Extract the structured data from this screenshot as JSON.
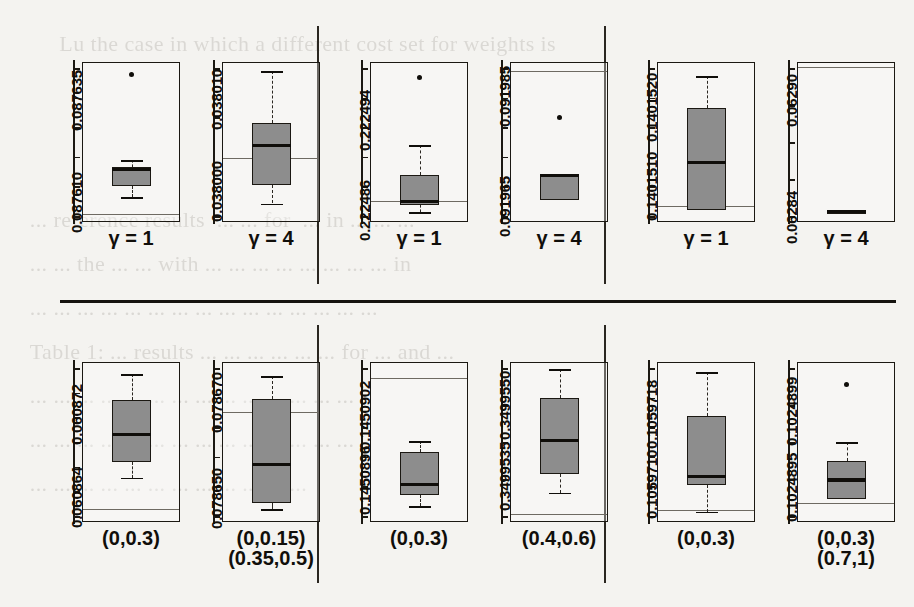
{
  "figure": {
    "type": "boxplot-grid",
    "rows": 2,
    "groups_per_row": 3,
    "panels_per_group": 2,
    "colors": {
      "box_fill": "#8d8d8d",
      "ink": "#100e0a",
      "reference_line": "#6e6a62",
      "page": "#f4f3f0"
    }
  },
  "ghost_text": "       Lu the case in which a different cost set for weights is\n\n\n\n  ... reference results  ... ... for  ... in ... ... ...\n  ... ... the ... ... with ... ... ... ... ... ... ... ... in\n  ... ... ... ... ... ... ... ... ... ... ... ... ... ... ...\n  Table 1: ... results ... ... ... ... ... ... for ... and ...\n  ... ... ... ... ... ... ... ... ... ... ... ... ... ...\n  ... ... ... ... ... ... ... ... ... ... ... ... ... ...\n  ... ... ... ... ... ... ... ... ... ... ... ...\n\n\n  ... Version\n\n\n  ... ... ... ... ...",
  "chart_data": [
    {
      "type": "boxplot",
      "id": "row1-group1-panel1",
      "row": 1,
      "group": 1,
      "index": 1,
      "xlabel": [
        "γ = 1"
      ],
      "ytick_labels": [
        "0.087610",
        "0.087635"
      ],
      "ytick_values": [
        0.08761,
        0.087635
      ],
      "ylim": [
        0.0876025,
        0.0876415
      ],
      "n_ticks": 6,
      "reference_line": 0.0876045,
      "stats": {
        "min": 0.0876085,
        "q1": 0.0876113,
        "median": 0.0876152,
        "q3": 0.0876158,
        "max": 0.0876175
      },
      "outliers": [
        0.0876385
      ]
    },
    {
      "type": "boxplot",
      "id": "row1-group1-panel2",
      "row": 1,
      "group": 1,
      "index": 2,
      "xlabel": [
        "γ = 4"
      ],
      "ytick_labels": [
        "0.038000",
        "0.038010"
      ],
      "ytick_values": [
        0.038,
        0.03801
      ],
      "ylim": [
        0.0379955,
        0.0380128
      ],
      "n_ticks": 4,
      "reference_line": 0.0380024,
      "stats": {
        "min": 0.0379975,
        "q1": 0.0379995,
        "median": 0.0380038,
        "q3": 0.0380062,
        "max": 0.0380118
      },
      "outliers": []
    },
    {
      "type": "boxplot",
      "id": "row1-group2-panel1",
      "row": 1,
      "group": 2,
      "index": 1,
      "xlabel": [
        "γ = 1"
      ],
      "ytick_labels": [
        "0.222486",
        "0.222494"
      ],
      "ytick_values": [
        0.222486,
        0.222494
      ],
      "ylim": [
        0.222484,
        0.2224982
      ],
      "n_ticks": 6,
      "reference_line": 0.2224859,
      "stats": {
        "min": 0.2224849,
        "q1": 0.2224855,
        "median": 0.2224858,
        "q3": 0.2224882,
        "max": 0.2224908
      },
      "outliers": [
        0.2224968
      ]
    },
    {
      "type": "boxplot",
      "id": "row1-group2-panel2",
      "row": 1,
      "group": 2,
      "index": 2,
      "xlabel": [
        "γ = 4"
      ],
      "ytick_labels": [
        "0.091965",
        "0.091985"
      ],
      "ytick_values": [
        0.091965,
        0.091985
      ],
      "ylim": [
        0.09196,
        0.0919892
      ],
      "n_ticks": 6,
      "reference_line": 0.0919875,
      "stats": {
        "min": 0.091964,
        "q1": 0.091964,
        "median": 0.0919685,
        "q3": 0.0919688,
        "max": 0.0919688
      },
      "outliers": [
        0.091979
      ]
    },
    {
      "type": "boxplot",
      "id": "row1-group3-panel1",
      "row": 1,
      "group": 3,
      "index": 1,
      "xlabel": [
        "γ = 1"
      ],
      "ytick_labels": [
        "0.1401510",
        "0.1401520"
      ],
      "ytick_values": [
        0.140151,
        0.140152
      ],
      "ylim": [
        0.14015045,
        0.14015248
      ],
      "n_ticks": 6,
      "reference_line": 0.14015065,
      "stats": {
        "min": 0.1401506,
        "q1": 0.1401506,
        "median": 0.1401512,
        "q3": 0.1401519,
        "max": 0.1401523
      },
      "outliers": []
    },
    {
      "type": "boxplot",
      "id": "row1-group3-panel2",
      "row": 1,
      "group": 3,
      "index": 2,
      "xlabel": [
        "γ = 4"
      ],
      "ytick_labels": [
        "0.06284",
        "0.06290"
      ],
      "ytick_values": [
        0.06284,
        0.0629
      ],
      "ylim": [
        0.06283,
        0.0629115
      ],
      "n_ticks": 5,
      "reference_line": 0.062909,
      "stats": {
        "min": 0.0628345,
        "q1": 0.0628348,
        "median": 0.0628352,
        "q3": 0.0628356,
        "max": 0.0628358
      },
      "outliers": []
    },
    {
      "type": "boxplot",
      "id": "row2-group1-panel1",
      "row": 2,
      "group": 1,
      "index": 1,
      "xlabel": [
        "(0,0.3)"
      ],
      "ytick_labels": [
        "0.060864",
        "0.060872"
      ],
      "ytick_values": [
        0.060864,
        0.060872
      ],
      "ylim": [
        0.0608605,
        0.060876
      ],
      "n_ticks": 7,
      "reference_line": 0.0608618,
      "stats": {
        "min": 0.0608648,
        "q1": 0.0608663,
        "median": 0.060869,
        "q3": 0.0608723,
        "max": 0.0608748
      },
      "outliers": []
    },
    {
      "type": "boxplot",
      "id": "row2-group1-panel2",
      "row": 2,
      "group": 1,
      "index": 2,
      "xlabel": [
        "(0,0.15)",
        "(0.35,0.5)"
      ],
      "ytick_labels": [
        "0.078650",
        "0.078670"
      ],
      "ytick_values": [
        0.07865,
        0.07867
      ],
      "ylim": [
        0.0786428,
        0.078676
      ],
      "n_ticks": 6,
      "reference_line": 0.0786656,
      "stats": {
        "min": 0.0786455,
        "q1": 0.0786468,
        "median": 0.0786548,
        "q3": 0.0786683,
        "max": 0.078673
      },
      "outliers": []
    },
    {
      "type": "boxplot",
      "id": "row2-group2-panel1",
      "row": 2,
      "group": 2,
      "index": 1,
      "xlabel": [
        "(0,0.3)"
      ],
      "ytick_labels": [
        "0.1450896",
        "0.1450902"
      ],
      "ytick_values": [
        0.1450896,
        0.1450902
      ],
      "ylim": [
        0.14508915,
        0.14509063
      ],
      "n_ticks": 6,
      "reference_line": 0.14509048,
      "stats": {
        "min": 0.1450893,
        "q1": 0.1450894,
        "median": 0.1450895,
        "q3": 0.1450898,
        "max": 0.1450899
      },
      "outliers": []
    },
    {
      "type": "boxplot",
      "id": "row2-group2-panel2",
      "row": 2,
      "group": 2,
      "index": 2,
      "xlabel": [
        "(0.4,0.6)"
      ],
      "ytick_labels": [
        "0.3499535",
        "0.3499550"
      ],
      "ytick_values": [
        0.3499535,
        0.349955
      ],
      "ylim": [
        0.34995238,
        0.34995575
      ],
      "n_ticks": 5,
      "reference_line": 0.34995255,
      "stats": {
        "min": 0.349953,
        "q1": 0.3499534,
        "median": 0.3499541,
        "q3": 0.349955,
        "max": 0.3499556
      },
      "outliers": []
    },
    {
      "type": "boxplot",
      "id": "row2-group3-panel1",
      "row": 2,
      "group": 3,
      "index": 1,
      "xlabel": [
        "(0,0.3)"
      ],
      "ytick_labels": [
        "0.1059710",
        "0.1059718"
      ],
      "ytick_values": [
        0.105971,
        0.1059718
      ],
      "ylim": [
        0.10597048,
        0.10597232
      ],
      "n_ticks": 6,
      "reference_line": 0.10597062,
      "stats": {
        "min": 0.1059706,
        "q1": 0.1059709,
        "median": 0.105971,
        "q3": 0.1059717,
        "max": 0.1059722
      },
      "outliers": []
    },
    {
      "type": "boxplot",
      "id": "row2-group3-panel2",
      "row": 2,
      "group": 3,
      "index": 2,
      "xlabel": [
        "(0,0.3)",
        "(0.7,1)"
      ],
      "ytick_labels": [
        "0.1024895",
        "0.1024899"
      ],
      "ytick_values": [
        0.1024895,
        0.1024899
      ],
      "ylim": [
        0.10248928,
        0.10249012
      ],
      "n_ticks": 5,
      "reference_line": 0.10248938,
      "stats": {
        "min": 0.1024894,
        "q1": 0.1024894,
        "median": 0.1024895,
        "q3": 0.1024896,
        "max": 0.1024897
      },
      "outliers": [
        0.10249
      ]
    }
  ]
}
